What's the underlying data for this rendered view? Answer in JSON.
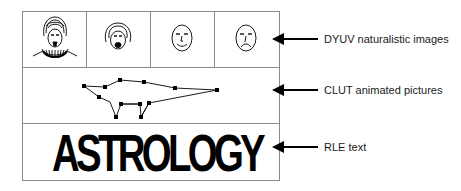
{
  "diagram": {
    "title": "",
    "rows": [
      {
        "id": "dyuv",
        "label": "DYUV naturalistic images",
        "content": "faces",
        "faces": [
          {
            "name": "ruffled-collar-portrait"
          },
          {
            "name": "bonnet-face-open-mouth"
          },
          {
            "name": "smiling-face"
          },
          {
            "name": "frowning-face"
          }
        ]
      },
      {
        "id": "clut",
        "label": "CLUT animated pictures",
        "content": "line-figure"
      },
      {
        "id": "rle",
        "label": "RLE text",
        "content": "text",
        "text": "ASTROLOGY"
      }
    ],
    "colors": {
      "border": "#8a8a8a",
      "ink": "#000000",
      "background": "#ffffff"
    }
  }
}
